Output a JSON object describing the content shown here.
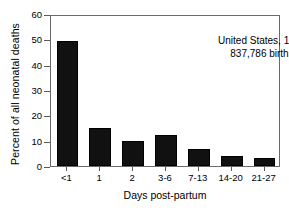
{
  "chart_data": {
    "type": "bar",
    "title": "",
    "subtitle": "",
    "xlabel": "Days post-partum",
    "ylabel": "Percent of all neonatal deaths",
    "categories": [
      "<1",
      "1",
      "2",
      "3-6",
      "7-13",
      "14-20",
      "21-27"
    ],
    "values": [
      49.5,
      15.2,
      10.0,
      12.3,
      6.8,
      3.8,
      3.0
    ],
    "series": [
      {
        "name": "Percent of all neonatal deaths",
        "values": [
          49.5,
          15.2,
          10.0,
          12.3,
          6.8,
          3.8,
          3.0
        ]
      }
    ],
    "ylim": [
      0,
      60
    ],
    "yticks": [
      0,
      10,
      20,
      30,
      40,
      50,
      60
    ],
    "ytick_labels": [
      "0",
      "10",
      "20",
      "30",
      "40",
      "50",
      "60"
    ],
    "grid": false,
    "legend": false,
    "legend_position": "none",
    "bar_color": "#111111",
    "axis_color": "#6a6a6a",
    "annotations": [
      "United States, 1950",
      "837,786 births"
    ]
  }
}
